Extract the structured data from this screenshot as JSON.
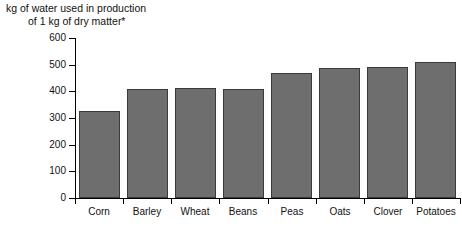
{
  "chart_data": {
    "type": "bar",
    "title": "kg of water used in production of 1 kg of dry matter*",
    "title_line1": "kg of water used in production",
    "title_line2": "of 1 kg of dry matter*",
    "xlabel": "",
    "ylabel": "",
    "ylim": [
      0,
      600
    ],
    "ytick_labels": [
      "0",
      "100",
      "200",
      "300",
      "400",
      "500",
      "600"
    ],
    "ytick_values": [
      0,
      100,
      200,
      300,
      400,
      500,
      600
    ],
    "grid": false,
    "legend": "none",
    "bar_color": "#6e6e6e",
    "bar_edge_color": "#3a3a3a",
    "axis_color": "#000000",
    "categories": [
      "Corn",
      "Barley",
      "Wheat",
      "Beans",
      "Peas",
      "Oats",
      "Clover",
      "Potatoes"
    ],
    "values": [
      325,
      408,
      412,
      410,
      470,
      487,
      490,
      510
    ]
  }
}
